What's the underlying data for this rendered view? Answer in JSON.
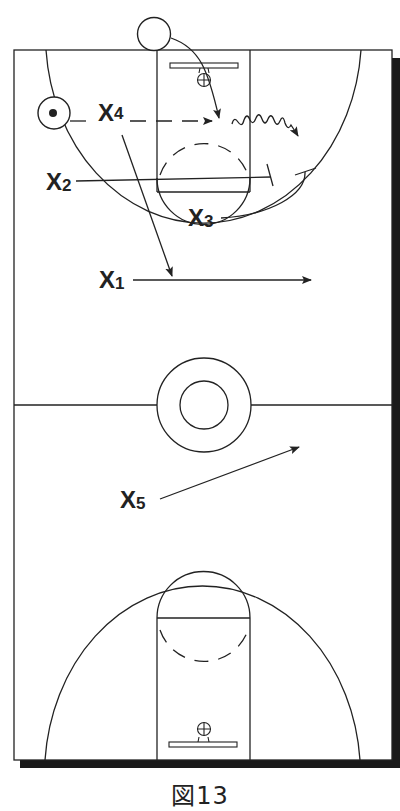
{
  "figure": {
    "caption": "図13",
    "type": "basketball-court-play-diagram"
  },
  "players": [
    {
      "id": "X1",
      "letter": "X",
      "number": "1"
    },
    {
      "id": "X2",
      "letter": "X",
      "number": "2"
    },
    {
      "id": "X3",
      "letter": "X",
      "number": "3"
    },
    {
      "id": "X4",
      "letter": "X",
      "number": "4"
    },
    {
      "id": "X5",
      "letter": "X",
      "number": "5"
    }
  ],
  "offense": [
    {
      "id": "ball-handler",
      "symbol": "circle-with-dot"
    },
    {
      "id": "inbounder",
      "symbol": "circle"
    }
  ],
  "legend_symbols": {
    "solid-arrow": "movement",
    "dashed-arrow": "pass",
    "wavy-arrow": "dribble",
    "t-bar": "screen"
  },
  "colors": {
    "ink": "#222222",
    "background": "#ffffff",
    "shadow": "#1a1a1a"
  }
}
